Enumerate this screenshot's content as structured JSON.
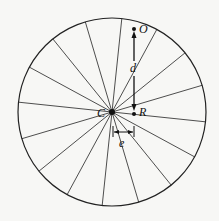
{
  "diagram": {
    "type": "wheel-with-spokes",
    "circle": {
      "cx": 112,
      "cy": 112,
      "r": 94
    },
    "spoke_count": 16,
    "spoke_start_angle_deg": 6,
    "stroke_color": "#222222",
    "labels": {
      "center": "C",
      "top_point": "O",
      "offset_point": "R",
      "vertical_distance": "d",
      "horizontal_offset": "e"
    },
    "points": {
      "C": {
        "x": 112,
        "y": 112
      },
      "O": {
        "x": 134,
        "y": 29
      },
      "R": {
        "x": 134,
        "y": 114
      }
    }
  }
}
